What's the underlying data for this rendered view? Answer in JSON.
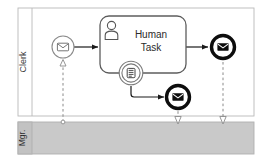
{
  "diagram": {
    "type": "bpmn-collaboration",
    "title_visible": false,
    "colors": {
      "stroke": "#6b6b6b",
      "dark_stroke": "#111111",
      "lane_fill_mgr": "#c9c9c9",
      "lane_fill_clerk": "#ffffff",
      "text": "#2b2b2b",
      "message_flow": "#8a8a8a"
    }
  },
  "lanes": [
    {
      "id": "lane-clerk",
      "label": "Clerk",
      "orientation": "vertical-label",
      "fill": "#ffffff"
    },
    {
      "id": "lane-mgr",
      "label": "Mgr.",
      "orientation": "vertical-label",
      "fill": "#c9c9c9"
    }
  ],
  "nodes": [
    {
      "id": "start-message-event",
      "kind": "start-event",
      "event_type": "message",
      "icon": "envelope-icon",
      "label": "",
      "lane": "lane-clerk"
    },
    {
      "id": "human-task",
      "kind": "task",
      "task_type": "user-task",
      "icon": "person-icon",
      "label_line_1": "Human",
      "label_line_2": "Task",
      "lane": "lane-clerk"
    },
    {
      "id": "boundary-form-event",
      "kind": "boundary-event",
      "event_type": "form",
      "icon": "form-icon",
      "label": "",
      "attached_to": "human-task",
      "lane": "lane-clerk"
    },
    {
      "id": "end-message-event-top",
      "kind": "end-event",
      "event_type": "message-throw",
      "icon": "envelope-filled-icon",
      "label": "",
      "lane": "lane-clerk"
    },
    {
      "id": "end-message-event-bottom",
      "kind": "end-event",
      "event_type": "message-throw",
      "icon": "envelope-filled-icon",
      "label": "",
      "lane": "lane-clerk"
    }
  ],
  "sequence_flows": [
    {
      "id": "flow-start-to-task",
      "from": "start-message-event",
      "to": "human-task",
      "style": "solid",
      "arrow": "filled"
    },
    {
      "id": "flow-task-to-end-top",
      "from": "human-task",
      "to": "end-message-event-top",
      "style": "solid",
      "arrow": "filled"
    },
    {
      "id": "flow-boundary-to-end-bottom",
      "from": "boundary-form-event",
      "to": "end-message-event-bottom",
      "style": "solid",
      "arrow": "filled"
    }
  ],
  "message_flows": [
    {
      "id": "msg-mgr-to-start",
      "from": "lane-mgr",
      "to": "start-message-event",
      "style": "dashed",
      "arrow": "hollow-triangle",
      "direction": "up",
      "source_marker": "hollow-circle"
    },
    {
      "id": "msg-end-bottom-to-mgr",
      "from": "end-message-event-bottom",
      "to": "lane-mgr",
      "style": "dashed",
      "arrow": "hollow-triangle",
      "direction": "down",
      "source_marker": "none"
    },
    {
      "id": "msg-end-top-to-mgr",
      "from": "end-message-event-top",
      "to": "lane-mgr",
      "style": "dashed",
      "arrow": "hollow-triangle",
      "direction": "down",
      "source_marker": "none"
    }
  ]
}
